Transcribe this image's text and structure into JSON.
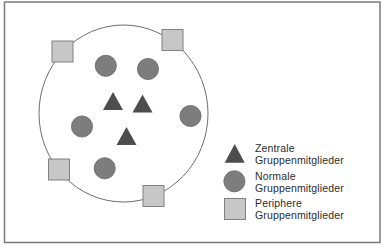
{
  "figure": {
    "frame_color": "#7a7a7a",
    "boundary_color": "#6e6e6e"
  },
  "colors": {
    "central": "#4d4d4d",
    "normal": "#7d7d7d",
    "normal_stroke": "#6a6a6a",
    "peripheral": "#c7c7c7",
    "peripheral_stroke": "#808080",
    "text": "#2b2b2b"
  },
  "diagram": {
    "boundary": {
      "shape": "ellipse",
      "cx": 123.5,
      "cy": 113.5,
      "rx": 84.5,
      "ry": 88.5
    },
    "members": [
      {
        "type": "central",
        "x": 113,
        "y": 92
      },
      {
        "type": "central",
        "x": 142.5,
        "y": 94.5
      },
      {
        "type": "central",
        "x": 126.5,
        "y": 127
      },
      {
        "type": "normal",
        "x": 105.8,
        "y": 65.8
      },
      {
        "type": "normal",
        "x": 148,
        "y": 69
      },
      {
        "type": "normal",
        "x": 82,
        "y": 126.5
      },
      {
        "type": "normal",
        "x": 190.5,
        "y": 116
      },
      {
        "type": "normal",
        "x": 104.7,
        "y": 168.3
      },
      {
        "type": "peripheral",
        "x": 52,
        "y": 41
      },
      {
        "type": "peripheral",
        "x": 162,
        "y": 29.5
      },
      {
        "type": "peripheral",
        "x": 48.5,
        "y": 159
      },
      {
        "type": "peripheral",
        "x": 143,
        "y": 185.5
      }
    ]
  },
  "legend": {
    "items": [
      {
        "type": "central",
        "icon": "triangle-icon",
        "line1": "Zentrale",
        "line2": "Gruppenmitglieder"
      },
      {
        "type": "normal",
        "icon": "circle-icon",
        "line1": "Normale",
        "line2": "Gruppenmitglieder"
      },
      {
        "type": "peripheral",
        "icon": "square-icon",
        "line1": "Periphere",
        "line2": "Gruppenmitglieder"
      }
    ]
  }
}
